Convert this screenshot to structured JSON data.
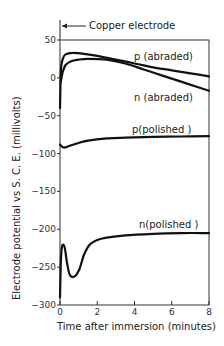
{
  "chart_data": {
    "type": "line",
    "title": "",
    "annotation_top": "Copper electrode",
    "xlabel": "Time after immersion (minutes)",
    "ylabel": "Electrode potential vs S. C. E. (millivolts)",
    "xlim": [
      0,
      8
    ],
    "ylim": [
      -300,
      50
    ],
    "xticks": [
      0,
      2,
      4,
      6,
      8
    ],
    "yticks": [
      50,
      0,
      -50,
      -100,
      -150,
      -200,
      -250,
      -300
    ],
    "grid": false,
    "legend": "inline labels",
    "series": [
      {
        "name": "p (abraded)",
        "x": [
          0,
          0.05,
          0.15,
          0.3,
          0.7,
          1.2,
          2,
          3,
          4,
          5,
          6,
          7,
          8
        ],
        "y": [
          -40,
          10,
          25,
          31,
          33,
          32,
          29,
          24,
          19,
          14,
          10,
          6,
          2
        ]
      },
      {
        "name": "n (abraded)",
        "x": [
          0.05,
          0.15,
          0.3,
          0.6,
          1,
          1.5,
          2.5,
          3.5,
          4.5,
          5.5,
          6.5,
          7.5,
          8
        ],
        "y": [
          -5,
          8,
          17,
          22,
          24,
          25,
          24,
          19,
          11,
          3,
          -5,
          -13,
          -17
        ]
      },
      {
        "name": "p(polished )",
        "x": [
          0,
          0.2,
          0.5,
          1,
          1.5,
          2.5,
          3.5,
          5,
          6.5,
          8
        ],
        "y": [
          -88,
          -92,
          -90,
          -86,
          -83,
          -80,
          -79,
          -78,
          -77.5,
          -77
        ]
      },
      {
        "name": "n(polished )",
        "x": [
          0,
          0.05,
          0.12,
          0.25,
          0.4,
          0.55,
          0.8,
          1.05,
          1.3,
          1.6,
          2,
          2.5,
          3.5,
          5,
          6.5,
          8
        ],
        "y": [
          -290,
          -240,
          -222,
          -224,
          -248,
          -261,
          -262,
          -252,
          -233,
          -220,
          -214,
          -211,
          -208,
          -206,
          -205,
          -205
        ]
      }
    ],
    "labels": {
      "p_abraded": "p (abraded)",
      "n_abraded": "n (abraded)",
      "p_polished": "p(polished )",
      "n_polished": "n(polished )"
    }
  }
}
